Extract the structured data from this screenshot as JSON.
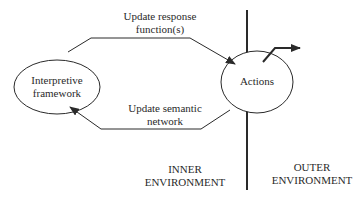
{
  "diagram": {
    "nodes": {
      "interpretive_framework": {
        "line1": "Interpretive",
        "line2": "framework"
      },
      "actions": {
        "label": "Actions"
      }
    },
    "edges": {
      "update_response": {
        "line1": "Update response",
        "line2": "function(s)"
      },
      "update_semantic": {
        "line1": "Update semantic",
        "line2": "network"
      }
    },
    "regions": {
      "inner": {
        "line1": "INNER",
        "line2": "ENVIRONMENT"
      },
      "outer": {
        "line1": "OUTER",
        "line2": "ENVIRONMENT"
      }
    },
    "colors": {
      "stroke": "#2a2a2a",
      "background": "#ffffff"
    }
  }
}
